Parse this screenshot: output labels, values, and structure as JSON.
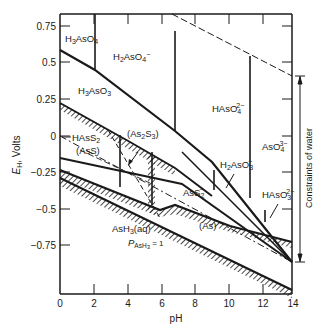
{
  "diagram": {
    "type": "Pourbaix (Eh-pH) diagram",
    "ink_color": "#1a1a1a",
    "background": "#ffffff",
    "x_axis": {
      "label": "pH",
      "range": [
        0,
        14
      ],
      "ticks": [
        "0",
        "2",
        "4",
        "6",
        "8",
        "10",
        "12",
        "14"
      ]
    },
    "y_axis": {
      "label": "E_H, Volts",
      "label_main": "E",
      "label_sub": "H",
      "label_rest": ", Volts",
      "range": [
        -1.08,
        0.82
      ],
      "ticks": [
        "0.75",
        "0.5",
        "0.25",
        "0",
        "−0.25",
        "−0.5",
        "−0.75"
      ]
    },
    "annotation_right": "Constraints of water",
    "regions": {
      "h3aso4": {
        "base": "H",
        "s1": "3",
        "mid": "AsO",
        "s2": "4",
        "sup": ""
      },
      "h2aso4": {
        "base": "H",
        "s1": "2",
        "mid": "AsO",
        "s2": "4",
        "sup": "−"
      },
      "h3aso3": {
        "base": "H",
        "s1": "3",
        "mid": "AsO",
        "s2": "3",
        "sup": ""
      },
      "haso4": {
        "base": "HAsO",
        "s1": "",
        "mid": "",
        "s2": "4",
        "sup": "2−"
      },
      "aso4": {
        "base": "AsO",
        "s1": "",
        "mid": "",
        "s2": "4",
        "sup": "3−"
      },
      "h2aso3": {
        "base": "H",
        "s1": "2",
        "mid": "AsO",
        "s2": "3",
        "sup": "−"
      },
      "haso3": {
        "base": "HAsO",
        "s1": "",
        "mid": "",
        "s2": "3",
        "sup": "2−"
      },
      "hass2": {
        "base": "HAsS",
        "s1": "",
        "mid": "",
        "s2": "2",
        "sup": ""
      },
      "as2s3": {
        "text": "(As",
        "s1": "2",
        "mid": "S",
        "s2": "3",
        "end": ")"
      },
      "ass": {
        "text": "(AsS)"
      },
      "ass2": {
        "base": "AsS",
        "s2": "2",
        "sup": "−"
      },
      "as": {
        "text": "(As)"
      },
      "ash3aq": {
        "base": "AsH",
        "s2": "3",
        "end": "(aq)"
      },
      "pash3": {
        "p": "P",
        "sub": "AsH",
        "sub2": "3",
        "eq": " = 1"
      }
    }
  }
}
